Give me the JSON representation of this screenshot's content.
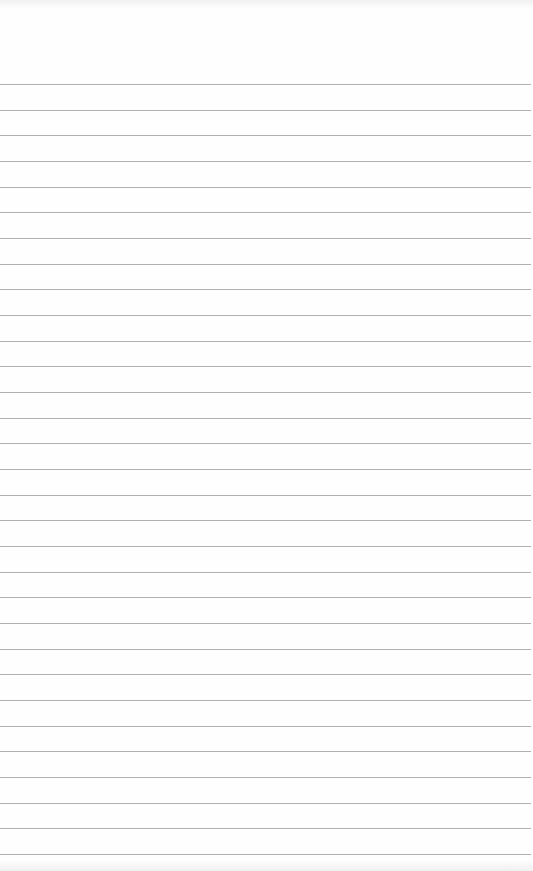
{
  "paper": {
    "type": "lined-paper",
    "background_color": "#fefefe",
    "rule_color": "#a9a9a9",
    "first_rule_y": 84,
    "rule_spacing": 25.67,
    "rule_count": 31,
    "text": ""
  }
}
